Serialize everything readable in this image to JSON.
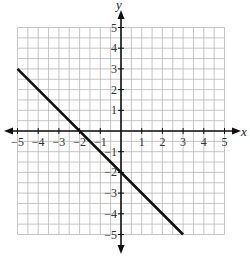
{
  "chart_data": {
    "type": "line",
    "title": "",
    "xlabel": "x",
    "ylabel": "y",
    "xlim": [
      -5,
      5
    ],
    "ylim": [
      -5,
      5
    ],
    "grid": true,
    "grid_step": 0.5,
    "x_ticks": [
      "-5",
      "-4",
      "-3",
      "-2",
      "-1",
      "1",
      "2",
      "3",
      "4",
      "5"
    ],
    "y_ticks": [
      "5",
      "4",
      "3",
      "2",
      "1",
      "-1",
      "-2",
      "-3",
      "-4",
      "-5"
    ],
    "series": [
      {
        "name": "line",
        "equation": "y = -x - 2",
        "points": [
          [
            -5,
            3
          ],
          [
            3,
            -5
          ]
        ],
        "color": "#111111"
      }
    ]
  },
  "labels": {
    "x_axis": "x",
    "y_axis": "y",
    "x_ticks": [
      "−5",
      "−4",
      "−3",
      "−2",
      "−1",
      "1",
      "2",
      "3",
      "4",
      "5"
    ],
    "y_ticks": [
      "5",
      "4",
      "3",
      "2",
      "1",
      "−1",
      "−2",
      "−3",
      "−4",
      "−5"
    ]
  },
  "colors": {
    "grid": "#b8b8b8",
    "axis": "#111111",
    "line": "#111111"
  }
}
